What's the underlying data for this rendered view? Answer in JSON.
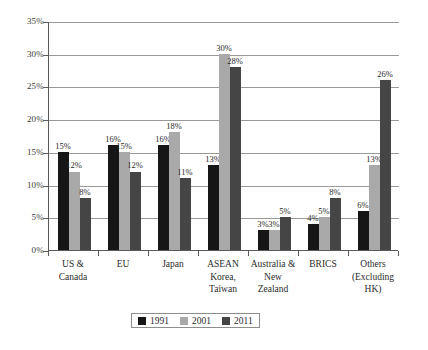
{
  "chart_data": {
    "type": "bar",
    "title": "",
    "subtitle": "",
    "xlabel": "",
    "ylabel": "",
    "ylim": [
      0,
      35
    ],
    "ytick_labels": [
      "0%",
      "5%",
      "10%",
      "15%",
      "20%",
      "25%",
      "30%",
      "35%"
    ],
    "ytick_values": [
      0,
      5,
      10,
      15,
      20,
      25,
      30,
      35
    ],
    "grid": true,
    "legend_position": "bottom",
    "value_suffix": "%",
    "categories": [
      "US &\nCanada",
      "EU",
      "Japan",
      "ASEAN\nKorea,\nTaiwan",
      "Australia &\nNew\nZealand",
      "BRICS",
      "Others\n(Excluding\nHK)"
    ],
    "category_lines": [
      [
        "US &",
        "Canada"
      ],
      [
        "EU"
      ],
      [
        "Japan"
      ],
      [
        "ASEAN",
        "Korea,",
        "Taiwan"
      ],
      [
        "Australia &",
        "New",
        "Zealand"
      ],
      [
        "BRICS"
      ],
      [
        "Others",
        "(Excluding",
        "HK)"
      ]
    ],
    "series": [
      {
        "name": "1991",
        "color": "#161616",
        "values": [
          15,
          16,
          16,
          13,
          3,
          4,
          6
        ],
        "labels": [
          "15%",
          "16%",
          "16%",
          "13%",
          "3%",
          "4%",
          "6%"
        ]
      },
      {
        "name": "2001",
        "color": "#a9a9a9",
        "values": [
          12,
          15,
          18,
          30,
          3,
          5,
          13
        ],
        "labels": [
          "12%",
          "15%",
          "18%",
          "30%",
          "3%",
          "5%",
          "13%"
        ]
      },
      {
        "name": "2011",
        "color": "#454545",
        "values": [
          8,
          12,
          11,
          28,
          5,
          8,
          26
        ],
        "labels": [
          "8%",
          "12%",
          "11%",
          "28%",
          "5%",
          "8%",
          "26%"
        ]
      }
    ]
  },
  "legend": {
    "items": [
      {
        "label": "1991",
        "color": "#161616"
      },
      {
        "label": "2001",
        "color": "#a9a9a9"
      },
      {
        "label": "2011",
        "color": "#454545"
      }
    ]
  },
  "caption": {
    "text": ""
  }
}
